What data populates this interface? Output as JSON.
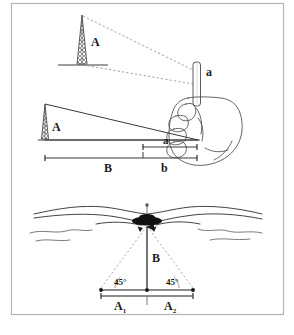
{
  "figure": {
    "title_strip": "",
    "border_color": "#b4b4b4",
    "background": "#ffffff",
    "ink_color": "#1a1a1a",
    "dashed_color": "#8c8c8c"
  },
  "panel_top": {
    "name": "stick-sighting-scene",
    "tower_label": "A",
    "stick_label": "a",
    "description_hidden": "",
    "sight_lines": 2
  },
  "panel_middle": {
    "name": "similar-triangles",
    "tower_label": "A",
    "near_segment_label": "a",
    "baseline_label": "B",
    "short_baseline_label": "b"
  },
  "panel_bottom": {
    "name": "forty-five-degree-method",
    "height_label": "B",
    "angle_left": "45°",
    "angle_right": "45°",
    "base_left_label": "A",
    "base_left_sub": "1",
    "base_right_label": "A",
    "base_right_sub": "2"
  }
}
